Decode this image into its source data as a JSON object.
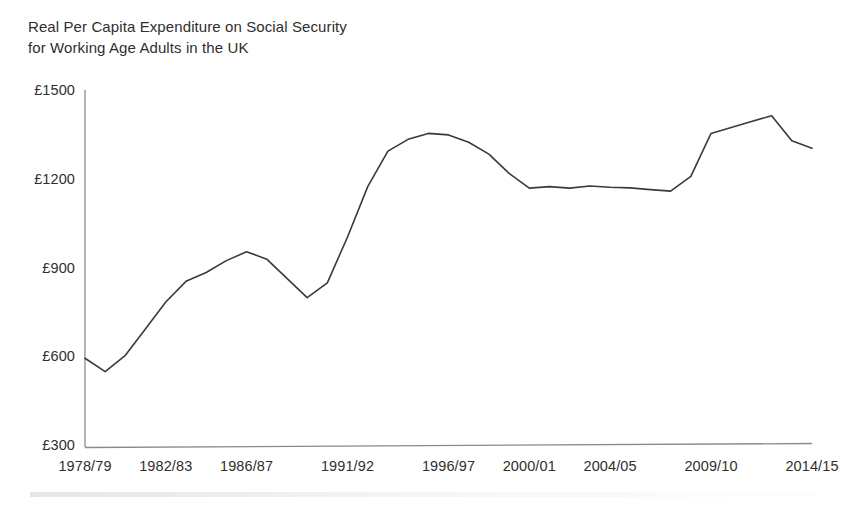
{
  "chart_data": {
    "type": "line",
    "title": "Real Per Capita Expenditure on Social Security\nfor Working Age Adults in the UK",
    "title_line1": "Real Per Capita Expenditure on Social Security",
    "title_line2": "for Working Age Adults in the UK",
    "xlabel": "",
    "ylabel": "",
    "ylim": [
      300,
      1500
    ],
    "ytick_values": [
      300,
      600,
      900,
      1200,
      1500
    ],
    "ytick_labels": [
      "£300",
      "£600",
      "£900",
      "£1200",
      "£1500"
    ],
    "currency_symbol": "£",
    "grid": false,
    "legend": false,
    "legend_position": "none",
    "line_color": "#3a3a3a",
    "background_color": "#ffffff",
    "axis_color": "#8a8a8a",
    "xtick_labels": [
      "1978/79",
      "1982/83",
      "1986/87",
      "1991/92",
      "1996/97",
      "2000/01",
      "2004/05",
      "2009/10",
      "2014/15"
    ],
    "xtick_categories": [
      "1978/79",
      "1982/83",
      "1986/87",
      "1991/92",
      "1996/97",
      "2000/01",
      "2004/05",
      "2009/10",
      "2014/15"
    ],
    "categories": [
      "1978/79",
      "1979/80",
      "1980/81",
      "1981/82",
      "1982/83",
      "1983/84",
      "1984/85",
      "1985/86",
      "1986/87",
      "1987/88",
      "1988/89",
      "1989/90",
      "1990/91",
      "1991/92",
      "1992/93",
      "1993/94",
      "1994/95",
      "1995/96",
      "1996/97",
      "1997/98",
      "1998/99",
      "1999/00",
      "2000/01",
      "2001/02",
      "2002/03",
      "2003/04",
      "2004/05",
      "2005/06",
      "2006/07",
      "2007/08",
      "2008/09",
      "2009/10",
      "2010/11",
      "2011/12",
      "2012/13",
      "2013/14",
      "2014/15"
    ],
    "values": [
      600,
      555,
      610,
      700,
      790,
      860,
      890,
      930,
      960,
      935,
      870,
      805,
      855,
      1010,
      1180,
      1300,
      1340,
      1360,
      1355,
      1330,
      1290,
      1225,
      1175,
      1180,
      1175,
      1182,
      1178,
      1176,
      1170,
      1165,
      1215,
      1360,
      1380,
      1400,
      1420,
      1335,
      1310
    ],
    "series_name": "Real per capita expenditure",
    "units": "£ per person (real terms)"
  },
  "figure": {
    "plot_left_px": 85,
    "plot_right_px": 812,
    "plot_top_px": 92,
    "plot_bottom_px": 447
  }
}
